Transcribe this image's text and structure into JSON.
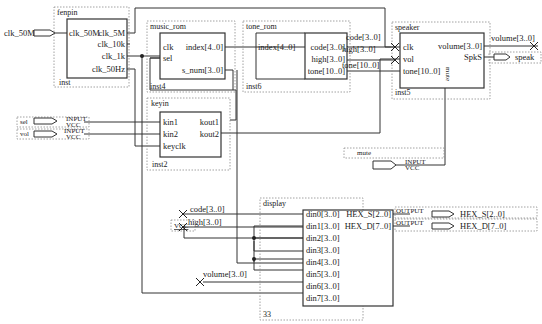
{
  "diagram": {
    "type": "quartus-block-schematic",
    "colors": {
      "wire": "#333333",
      "frame": "#8a8a8a",
      "background": "#ffffff"
    }
  },
  "blocks": {
    "fenpin": {
      "name": "fenpin",
      "instance": "inst",
      "inputs": [
        "clk_50M"
      ],
      "outputs": [
        "clk_5M",
        "clk_10k",
        "clk_1k",
        "clk_50Hz"
      ]
    },
    "music_rom": {
      "name": "music_rom",
      "instance": "inst4",
      "inputs": [
        "clk",
        "sel"
      ],
      "outputs": [
        "index[4..0]",
        "s_num[3..0]"
      ]
    },
    "tone_rom": {
      "name": "tone_rom",
      "instance": "inst6",
      "inputs": [
        "index[4..0]"
      ],
      "outputs": [
        "code[3..0]",
        "high[3..0]",
        "tone[10..0]"
      ]
    },
    "speaker": {
      "name": "speaker",
      "instance": "inst5",
      "inputs": [
        "clk",
        "vol",
        "tone[10..0]",
        "mute"
      ],
      "outputs": [
        "volume[3..0]",
        "SpkS"
      ]
    },
    "keyin": {
      "name": "keyin",
      "instance": "inst2",
      "inputs": [
        "kin1",
        "kin2",
        "keyclk"
      ],
      "outputs": [
        "kout1",
        "kout2"
      ]
    },
    "display": {
      "name": "display",
      "instance": "33",
      "inputs": [
        "din0[3..0]",
        "din1[3..0]",
        "din2[3..0]",
        "din3[3..0]",
        "din4[3..0]",
        "din5[3..0]",
        "din6[3..0]",
        "din7[3..0]",
        "clk"
      ],
      "outputs": [
        "HEX_S[2..0]",
        "HEX_D[7..0]"
      ]
    }
  },
  "pins": {
    "clk_50M": {
      "label": "clk_50M",
      "dir": "INPUT"
    },
    "sel": {
      "label": "sel",
      "dir": "INPUT",
      "type": "INPUT",
      "default": "VCC"
    },
    "vol": {
      "label": "vol",
      "dir": "INPUT",
      "type": "INPUT",
      "default": "VCC"
    },
    "mute": {
      "label": "mute",
      "dir": "INPUT",
      "type": "INPUT",
      "default": "VCC"
    },
    "speak": {
      "label": "speak",
      "dir": "OUTPUT"
    },
    "hex_s": {
      "label": "HEX_S[2..0]",
      "dir": "OUTPUT",
      "type": "OUTPUT"
    },
    "hex_d": {
      "label": "HEX_D[7..0]",
      "dir": "OUTPUT",
      "type": "OUTPUT"
    }
  },
  "nets": {
    "code_top": "code[3..0]",
    "high_top": "high[3..0]",
    "tone_top": "tone[10..0]",
    "volume_top": "volume[3..0]",
    "code_disp": "code[3..0]",
    "high_disp": "high[3..0]",
    "volume_disp": "volume[3..0]",
    "vcc": "VCC"
  }
}
